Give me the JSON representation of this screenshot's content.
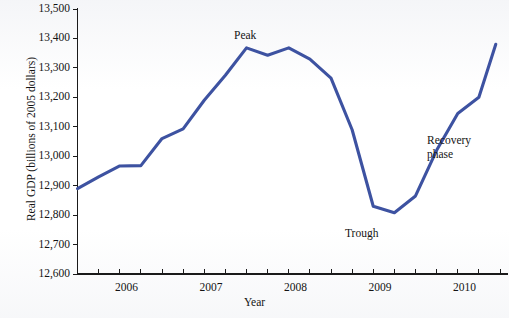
{
  "chart_data": {
    "type": "line",
    "title": "",
    "xlabel": "Year",
    "ylabel": "Real GDP (billions of 2005 dollars)",
    "ylim": [
      12600,
      13500
    ],
    "ytick_labels": [
      "13,500",
      "13,400",
      "13,300",
      "13,200",
      "13,100",
      "13,000",
      "12,900",
      "12,800",
      "12,700",
      "12,600"
    ],
    "ytick_values": [
      13500,
      13400,
      13300,
      13200,
      13100,
      13000,
      12900,
      12800,
      12700,
      12600
    ],
    "xtick_labels": [
      "2006",
      "2007",
      "2008",
      "2009",
      "2010"
    ],
    "xtick_values": [
      2006,
      2007,
      2008,
      2009,
      2010
    ],
    "xlim": [
      2005.5,
      2010.5
    ],
    "x_minor_tick_step": 0.25,
    "grid": false,
    "legend": "none",
    "series": [
      {
        "name": "Real GDP",
        "color": "#3d52a1",
        "x": [
          2005.5,
          2005.75,
          2006.0,
          2006.25,
          2006.5,
          2006.75,
          2007.0,
          2007.25,
          2007.5,
          2007.75,
          2008.0,
          2008.25,
          2008.5,
          2008.75,
          2009.0,
          2009.25,
          2009.5,
          2009.75,
          2010.0,
          2010.25,
          2010.45
        ],
        "values": [
          12890,
          12930,
          12967,
          12968,
          13060,
          13093,
          13190,
          13275,
          13368,
          13343,
          13368,
          13330,
          13265,
          13090,
          12830,
          12808,
          12865,
          13020,
          13145,
          13200,
          13380
        ]
      }
    ],
    "annotations": [
      {
        "name": "peak-label",
        "text": "Peak",
        "x": 2007.42,
        "y": 13410
      },
      {
        "name": "trough-label",
        "text": "Trough",
        "x": 2008.95,
        "y": 12780
      },
      {
        "name": "recovery-label",
        "text": "Recovery\nphase",
        "x": 2009.95,
        "y": 13120
      }
    ]
  },
  "annotations_text": {
    "peak": "Peak",
    "trough": "Trough",
    "recovery_line1": "Recovery",
    "recovery_line2": "phase"
  },
  "axis": {
    "x_title": "Year",
    "y_title": "Real GDP (billions of 2005 dollars)"
  }
}
